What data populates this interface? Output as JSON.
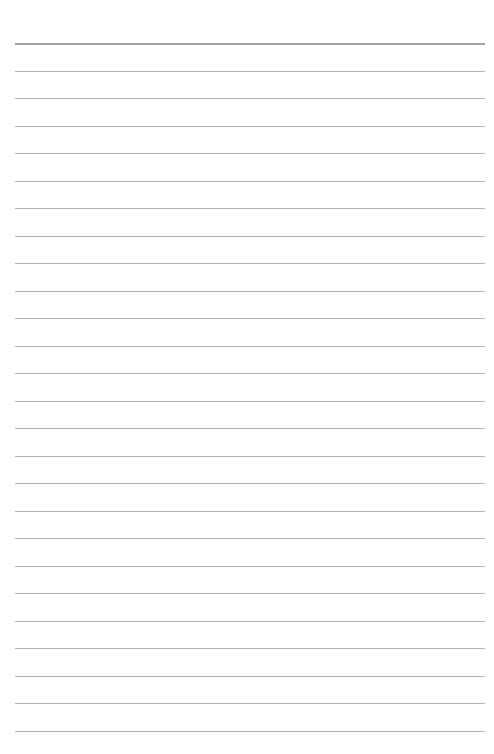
{
  "page": {
    "type": "lined-paper",
    "background_color": "#ffffff",
    "rule_color": "#b4b4b4",
    "header_rule_color": "#a2a2a2",
    "line_count": 26,
    "first_line_y": 43,
    "line_spacing": 27.5,
    "line_left": 15,
    "line_width": 470,
    "text": ""
  }
}
